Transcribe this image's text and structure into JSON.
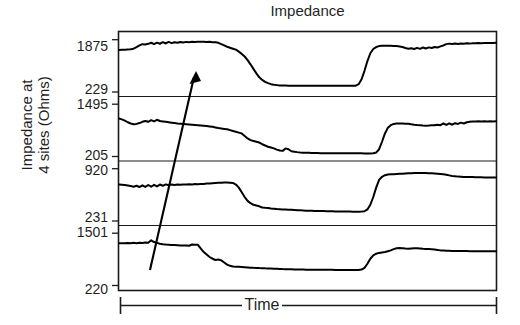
{
  "chart_data": {
    "type": "line",
    "title": "Impedance",
    "ylabel_line1": "Impedance at",
    "ylabel_line2": "4 sites (Ohms)",
    "xlabel": "Time",
    "grid": false,
    "legend": null,
    "xlim_note": "Time axis unlabeled (relative time, bracketed span)",
    "annotations": [
      {
        "type": "arrow",
        "label": "",
        "from": {
          "x_frac": 0.085,
          "y_panel": 4,
          "y_frac": 0.72
        },
        "to": {
          "x_frac": 0.206,
          "y_panel": 1,
          "y_frac": 0.33
        },
        "description": "diagonal arrow pointing up and to the right across all four panels"
      }
    ],
    "panels": [
      {
        "index": 1,
        "site": "Site 1",
        "ymax_label": "1875",
        "ymin_label": "229",
        "ylim": [
          229,
          1875
        ],
        "values": [
          1520,
          1528,
          1530,
          1534,
          1540,
          1560,
          1610,
          1660,
          1700,
          1688,
          1710,
          1742,
          1700,
          1745,
          1712,
          1760,
          1720,
          1768,
          1730,
          1760,
          1742,
          1768,
          1752,
          1770,
          1760,
          1772,
          1768,
          1775,
          1770,
          1772,
          1768,
          1770,
          1762,
          1758,
          1740,
          1700,
          1660,
          1620,
          1590,
          1560,
          1530,
          1470,
          1400,
          1320,
          1210,
          1080,
          940,
          800,
          680,
          600,
          540,
          500,
          470,
          450,
          440,
          432,
          428,
          426,
          424,
          424,
          422,
          422,
          420,
          420,
          420,
          420,
          420,
          420,
          420,
          420,
          420,
          420,
          420,
          420,
          420,
          420,
          420,
          420,
          420,
          420,
          420,
          424,
          470,
          620,
          880,
          1180,
          1420,
          1550,
          1610,
          1640,
          1648,
          1650,
          1648,
          1650,
          1645,
          1640,
          1630,
          1610,
          1580,
          1560,
          1572,
          1550,
          1586,
          1556,
          1596,
          1566,
          1600,
          1580,
          1612,
          1596,
          1630,
          1660,
          1700,
          1716,
          1704,
          1718,
          1706,
          1720,
          1712,
          1724,
          1716,
          1728,
          1724,
          1734,
          1730,
          1736,
          1734,
          1738,
          1736,
          1740
        ]
      },
      {
        "index": 2,
        "site": "Site 2",
        "ymax_label": "1495",
        "ymin_label": "205",
        "ylim": [
          205,
          1495
        ],
        "values": [
          1120,
          1100,
          1070,
          1030,
          1000,
          980,
          990,
          1010,
          1040,
          1060,
          1040,
          1080,
          1050,
          1090,
          1060,
          1050,
          1040,
          1030,
          1020,
          1010,
          1000,
          996,
          990,
          984,
          978,
          972,
          966,
          960,
          954,
          948,
          940,
          930,
          920,
          905,
          890,
          880,
          870,
          860,
          840,
          820,
          800,
          780,
          760,
          700,
          640,
          600,
          580,
          560,
          540,
          500,
          470,
          440,
          420,
          400,
          370,
          350,
          340,
          400,
          380,
          330,
          320,
          310,
          302,
          298,
          294,
          292,
          290,
          288,
          286,
          284,
          284,
          282,
          282,
          280,
          280,
          280,
          280,
          280,
          280,
          280,
          280,
          280,
          280,
          280,
          278,
          278,
          278,
          282,
          300,
          380,
          560,
          760,
          900,
          960,
          990,
          1000,
          1002,
          1000,
          996,
          992,
          980,
          970,
          962,
          958,
          952,
          948,
          950,
          956,
          960,
          972,
          960,
          1000,
          966,
          1004,
          970,
          1008,
          990,
          1020,
          1000,
          1030,
          1040,
          1048,
          1050,
          1052,
          1050,
          1052,
          1050,
          1052,
          1050,
          1052
        ]
      },
      {
        "index": 3,
        "site": "Site 3",
        "ymax_label": "920",
        "ymin_label": "231",
        "ylim": [
          231,
          920
        ],
        "values": [
          700,
          698,
          694,
          688,
          682,
          672,
          684,
          668,
          690,
          670,
          694,
          672,
          696,
          676,
          700,
          684,
          702,
          690,
          700,
          694,
          700,
          698,
          702,
          700,
          704,
          702,
          706,
          704,
          708,
          706,
          712,
          714,
          718,
          720,
          722,
          724,
          726,
          726,
          724,
          720,
          700,
          660,
          600,
          540,
          490,
          460,
          440,
          430,
          420,
          404,
          400,
          398,
          392,
          388,
          384,
          382,
          380,
          378,
          376,
          374,
          372,
          370,
          368,
          366,
          364,
          362,
          362,
          360,
          360,
          358,
          358,
          356,
          356,
          356,
          354,
          354,
          354,
          352,
          352,
          352,
          350,
          350,
          350,
          352,
          356,
          380,
          440,
          540,
          660,
          760,
          800,
          820,
          828,
          832,
          834,
          836,
          838,
          840,
          842,
          844,
          846,
          848,
          850,
          848,
          850,
          848,
          846,
          844,
          842,
          840,
          836,
          832,
          826,
          818,
          810,
          806,
          802,
          800,
          798,
          798,
          796,
          796,
          794,
          794,
          794,
          792,
          792,
          792,
          792,
          792
        ]
      },
      {
        "index": 4,
        "site": "Site 4",
        "ymax_label": "1501",
        "ymin_label": "220",
        "ylim": [
          220,
          1501
        ],
        "values": [
          1230,
          1232,
          1228,
          1236,
          1230,
          1240,
          1232,
          1244,
          1238,
          1250,
          1242,
          1300,
          1260,
          1240,
          1220,
          1208,
          1200,
          1196,
          1190,
          1186,
          1182,
          1178,
          1176,
          1174,
          1172,
          1200,
          1196,
          1192,
          1100,
          1020,
          960,
          900,
          860,
          830,
          840,
          820,
          770,
          720,
          690,
          676,
          670,
          666,
          660,
          655,
          650,
          646,
          642,
          640,
          636,
          634,
          630,
          628,
          624,
          620,
          618,
          616,
          612,
          610,
          608,
          606,
          604,
          602,
          600,
          600,
          598,
          598,
          596,
          596,
          596,
          596,
          594,
          594,
          594,
          594,
          592,
          592,
          592,
          592,
          592,
          592,
          592,
          592,
          592,
          600,
          640,
          740,
          860,
          940,
          980,
          1000,
          1010,
          1020,
          1040,
          1060,
          1090,
          1110,
          1116,
          1112,
          1104,
          1100,
          1104,
          1108,
          1110,
          1106,
          1100,
          1096,
          1092,
          1088,
          1080,
          1070,
          1060,
          1056,
          1052,
          1050,
          1048,
          1046,
          1046,
          1044,
          1044,
          1044,
          1042,
          1042,
          1042,
          1042,
          1040,
          1040,
          1040,
          1040,
          1040,
          1040
        ]
      }
    ]
  },
  "axis": {
    "y_tick_labels": [
      "1875",
      "229",
      "1495",
      "205",
      "920",
      "231",
      "1501",
      "220"
    ],
    "x_bracket_label": "Time"
  },
  "colors": {
    "line": "#000000",
    "axis": "#1a1a1a",
    "background": "#ffffff",
    "text": "#1f1f1f"
  }
}
